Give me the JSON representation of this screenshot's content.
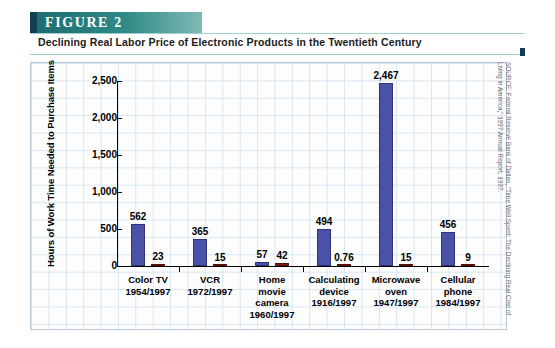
{
  "figure": {
    "label": "FIGURE  2",
    "subtitle": "Declining Real Labor Price of Electronic Products in the Twentieth Century",
    "source": "SOURCE: Federal Reserve Bank of Dallas, “Time Well Spent: The Declining Real Cost of Living in America,” 1997 Annual Report, 1997."
  },
  "colors": {
    "header_teal": "#2f8a86",
    "header_accent": "#123f52",
    "series_a": "#4a52a8",
    "series_b": "#7a1f14",
    "grid": "#d7e6f2"
  },
  "chart_data": {
    "type": "bar",
    "title": "Declining Real Labor Price of Electronic Products in the Twentieth Century",
    "xlabel": "",
    "ylabel": "Hours of Work Time Needed to Purchase Items",
    "ylim": [
      0,
      2500
    ],
    "yticks": [
      0,
      500,
      1000,
      1500,
      2000,
      2500
    ],
    "ytick_labels": [
      "0",
      "500",
      "1,000",
      "1,500",
      "2,000",
      "2,500"
    ],
    "grid": true,
    "legend": "none",
    "categories": [
      "Color TV\n1954/1997",
      "VCR\n1972/1997",
      "Home movie camera\n1960/1997",
      "Calculating device\n1916/1997",
      "Microwave oven\n1947/1997",
      "Cellular phone\n1984/1997"
    ],
    "series": [
      {
        "name": "Earlier year",
        "values": [
          562,
          365,
          57,
          494,
          2467,
          456
        ],
        "labels": [
          "562",
          "365",
          "57",
          "494",
          "2,467",
          "456"
        ]
      },
      {
        "name": "1997",
        "values": [
          23,
          15,
          42,
          0.76,
          15,
          9
        ],
        "labels": [
          "23",
          "15",
          "42",
          "0.76",
          "15",
          "9"
        ]
      }
    ]
  },
  "groups": [
    {
      "name_lines": [
        "Color TV",
        "1954/1997"
      ],
      "a_label": "562",
      "b_label": "23",
      "a_value": 562,
      "b_value": 23
    },
    {
      "name_lines": [
        "VCR",
        "1972/1997"
      ],
      "a_label": "365",
      "b_label": "15",
      "a_value": 365,
      "b_value": 15
    },
    {
      "name_lines": [
        "Home",
        "movie",
        "camera",
        "1960/1997"
      ],
      "a_label": "57",
      "b_label": "42",
      "a_value": 57,
      "b_value": 42
    },
    {
      "name_lines": [
        "Calculating",
        "device",
        "1916/1997"
      ],
      "a_label": "494",
      "b_label": "0.76",
      "a_value": 494,
      "b_value": 0.76
    },
    {
      "name_lines": [
        "Microwave",
        "oven",
        "1947/1997"
      ],
      "a_label": "2,467",
      "b_label": "15",
      "a_value": 2467,
      "b_value": 15
    },
    {
      "name_lines": [
        "Cellular",
        "phone",
        "1984/1997"
      ],
      "a_label": "456",
      "b_label": "9",
      "a_value": 456,
      "b_value": 9
    }
  ]
}
